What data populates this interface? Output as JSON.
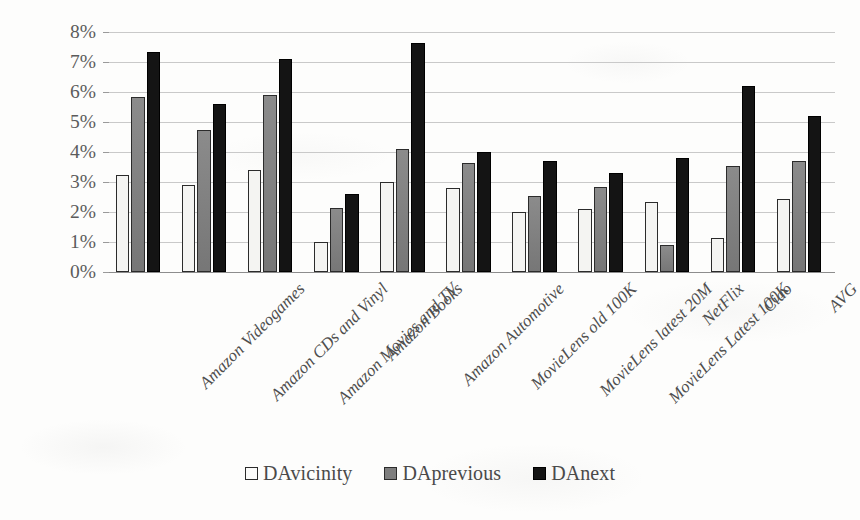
{
  "chart_data": {
    "type": "bar",
    "title": "",
    "subtitle": "",
    "xlabel": "",
    "ylabel": "",
    "ylim": [
      0,
      8
    ],
    "ytick_labels": [
      "0%",
      "1%",
      "2%",
      "3%",
      "4%",
      "5%",
      "6%",
      "7%",
      "8%"
    ],
    "ytick_values": [
      0,
      1,
      2,
      3,
      4,
      5,
      6,
      7,
      8
    ],
    "y_unit": "%",
    "grid": true,
    "legend_position": "bottom",
    "categories": [
      "Amazon Videogames",
      "Amazon CDs and Vinyl",
      "Amazon Movies and TV",
      "Amazon Books",
      "Amazon Automotive",
      "MovieLens old 100K",
      "MovieLens latest 20M",
      "MovieLens Latest 100K",
      "NetFlix",
      "Ciao",
      "AVG"
    ],
    "series": [
      {
        "name": "DAvicinity",
        "color": "#f4f4f2",
        "values": [
          3.25,
          2.9,
          3.4,
          1.0,
          3.0,
          2.8,
          2.0,
          2.1,
          2.35,
          1.15,
          2.45
        ]
      },
      {
        "name": "DAprevious",
        "color": "#7e7e7e",
        "values": [
          5.85,
          4.75,
          5.9,
          2.15,
          4.1,
          3.65,
          2.55,
          2.85,
          0.9,
          3.55,
          3.7
        ]
      },
      {
        "name": "DAnext",
        "color": "#141414",
        "values": [
          7.35,
          5.6,
          7.1,
          2.6,
          7.65,
          4.0,
          3.7,
          3.3,
          3.8,
          6.2,
          5.2
        ]
      }
    ]
  },
  "legend": {
    "entries": [
      {
        "label": "DAvicinity",
        "swatch": "open-square-icon"
      },
      {
        "label": "DAprevious",
        "swatch": "gray-square-icon"
      },
      {
        "label": "DAnext",
        "swatch": "black-square-icon"
      }
    ]
  }
}
